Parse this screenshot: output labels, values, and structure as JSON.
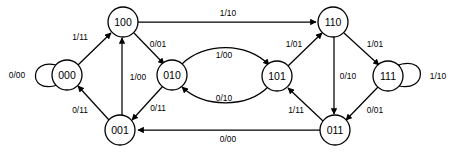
{
  "diagram": {
    "type": "finite-state-machine",
    "title": "",
    "node_label_format": "state-bits",
    "edge_label_format": "input/output",
    "line_color": "#000000",
    "node_fill": "#ffffff",
    "background": "#ffffff",
    "nodes": [
      {
        "id": "100",
        "label": "100",
        "cx": 123,
        "cy": 22,
        "r": 15
      },
      {
        "id": "110",
        "label": "110",
        "cx": 333,
        "cy": 22,
        "r": 15
      },
      {
        "id": "000",
        "label": "000",
        "cx": 67,
        "cy": 75,
        "r": 15
      },
      {
        "id": "010",
        "label": "010",
        "cx": 172,
        "cy": 75,
        "r": 15
      },
      {
        "id": "101",
        "label": "101",
        "cx": 277,
        "cy": 76,
        "r": 15
      },
      {
        "id": "111",
        "label": "111",
        "cx": 388,
        "cy": 76,
        "r": 15
      },
      {
        "id": "001",
        "label": "001",
        "cx": 120,
        "cy": 130,
        "r": 15
      },
      {
        "id": "011",
        "label": "011",
        "cx": 335,
        "cy": 130,
        "r": 15
      }
    ],
    "edges": [
      {
        "from": "100",
        "to": "110",
        "label": "1/10",
        "lx": 228,
        "ly": 13
      },
      {
        "from": "000",
        "to": "000",
        "label": "0/00",
        "lx": 17,
        "ly": 75,
        "self_loop": true
      },
      {
        "from": "111",
        "to": "111",
        "label": "1/10",
        "lx": 438,
        "ly": 76,
        "self_loop": true
      },
      {
        "from": "000",
        "to": "100",
        "label": "1/11",
        "lx": 80,
        "ly": 37
      },
      {
        "from": "001",
        "to": "000",
        "label": "0/11",
        "lx": 80,
        "ly": 110
      },
      {
        "from": "001",
        "to": "100",
        "label": "1/00",
        "lx": 138,
        "ly": 77
      },
      {
        "from": "100",
        "to": "010",
        "label": "0/01",
        "lx": 158,
        "ly": 44
      },
      {
        "from": "010",
        "to": "001",
        "label": "0/11",
        "lx": 158,
        "ly": 108
      },
      {
        "from": "010",
        "to": "101",
        "label": "1/00",
        "lx": 224,
        "ly": 55
      },
      {
        "from": "101",
        "to": "010",
        "label": "0/10",
        "lx": 224,
        "ly": 98
      },
      {
        "from": "101",
        "to": "110",
        "label": "1/01",
        "lx": 294,
        "ly": 44
      },
      {
        "from": "011",
        "to": "101",
        "label": "1/11",
        "lx": 296,
        "ly": 110
      },
      {
        "from": "110",
        "to": "011",
        "label": "0/10",
        "lx": 348,
        "ly": 76
      },
      {
        "from": "110",
        "to": "111",
        "label": "1/01",
        "lx": 375,
        "ly": 44
      },
      {
        "from": "111",
        "to": "011",
        "label": "0/01",
        "lx": 375,
        "ly": 110
      },
      {
        "from": "011",
        "to": "001",
        "label": "0/00",
        "lx": 228,
        "ly": 139
      }
    ]
  }
}
